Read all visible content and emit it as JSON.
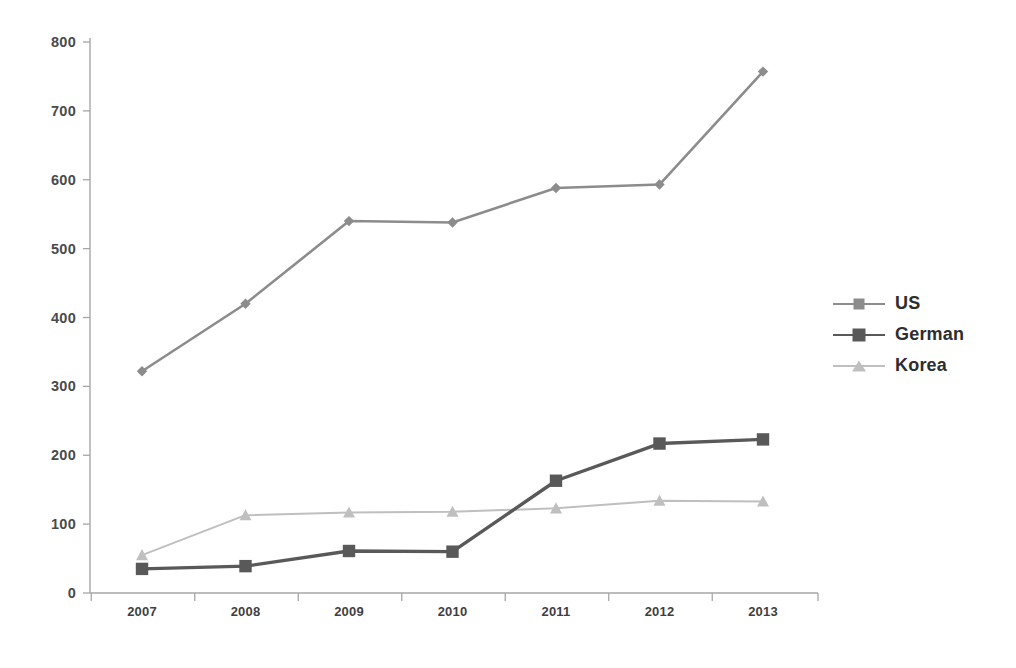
{
  "chart_data": {
    "type": "line",
    "title": "",
    "xlabel": "",
    "ylabel": "",
    "categories": [
      "2007",
      "2008",
      "2009",
      "2010",
      "2011",
      "2012",
      "2013"
    ],
    "ylim": [
      0,
      800
    ],
    "ytick_values": [
      0,
      100,
      200,
      300,
      400,
      500,
      600,
      700,
      800
    ],
    "ytick_labels": [
      "0",
      "100",
      "200",
      "300",
      "400",
      "500",
      "600",
      "700",
      "800"
    ],
    "grid": false,
    "legend_position": "right",
    "series": [
      {
        "name": "US",
        "marker": "diamond",
        "color": "#8c8c8c",
        "values": [
          322,
          420,
          540,
          538,
          588,
          593,
          757
        ]
      },
      {
        "name": "German",
        "marker": "square",
        "color": "#595959",
        "values": [
          35,
          39,
          61,
          60,
          163,
          217,
          223
        ]
      },
      {
        "name": "Korea",
        "marker": "triangle",
        "color": "#bfbfbf",
        "values": [
          55,
          113,
          117,
          118,
          123,
          134,
          133
        ]
      }
    ]
  },
  "axis": {
    "line_color": "#a6a6a6",
    "tick_color": "#a6a6a6"
  },
  "legend": {
    "items": [
      {
        "label": "US"
      },
      {
        "label": "German"
      },
      {
        "label": "Korea"
      }
    ]
  }
}
